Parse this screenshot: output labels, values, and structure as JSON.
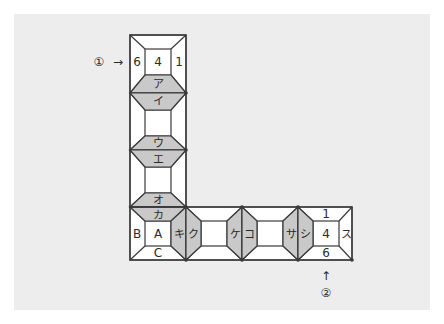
{
  "figure": {
    "type": "diagram",
    "background_color": "#ffffff",
    "panel_color": "#ededed",
    "line_color": "#3a3a3a",
    "cell_fill": "#ffffff",
    "shaded_fill": "#c9c9c9",
    "text_color": "#2b2b2b"
  },
  "markers": [
    {
      "id": "marker-1",
      "symbol": "①",
      "arrow": "→",
      "position": "left-of-top-cell"
    },
    {
      "id": "marker-2",
      "symbol": "②",
      "arrow": "↑",
      "position": "below-right-cell"
    }
  ],
  "vertical_column": {
    "orientation": "vertical",
    "cells": [
      {
        "index": 0,
        "faces": {
          "left": "6",
          "center": "4",
          "right": "1",
          "bottom": "ア"
        },
        "shaded_faces": [
          "bottom"
        ]
      },
      {
        "index": 1,
        "faces": {
          "top": "イ",
          "bottom": "ウ"
        },
        "shaded_faces": [
          "top",
          "bottom"
        ]
      },
      {
        "index": 2,
        "faces": {
          "top": "エ",
          "bottom": "オ"
        },
        "shaded_faces": [
          "top",
          "bottom"
        ]
      },
      {
        "index": 3,
        "faces": {
          "top": "カ",
          "left": "B",
          "center": "A",
          "bottom": "C"
        },
        "shaded_faces": [
          "top"
        ]
      }
    ]
  },
  "horizontal_row": {
    "orientation": "horizontal",
    "cells": [
      {
        "index": 0,
        "faces": {
          "top": "カ",
          "left": "B",
          "center": "A",
          "bottom": "C",
          "right": "キ"
        },
        "shaded_faces": [
          "top",
          "right"
        ],
        "note": "shared corner cell with vertical column"
      },
      {
        "index": 1,
        "faces": {
          "left": "ク",
          "right": "ケ"
        },
        "shaded_faces": [
          "left",
          "right"
        ]
      },
      {
        "index": 2,
        "faces": {
          "left": "コ",
          "right": "サ"
        },
        "shaded_faces": [
          "left",
          "right"
        ]
      },
      {
        "index": 3,
        "faces": {
          "left": "シ",
          "top": "1",
          "center": "4",
          "bottom": "6",
          "right": "ス"
        },
        "shaded_faces": [
          "left"
        ]
      }
    ]
  },
  "all_kana_labels": [
    "ア",
    "イ",
    "ウ",
    "エ",
    "オ",
    "カ",
    "キ",
    "ク",
    "ケ",
    "コ",
    "サ",
    "シ",
    "ス"
  ],
  "all_numbers": [
    "6",
    "4",
    "1",
    "1",
    "4",
    "6"
  ],
  "all_letters": [
    "B",
    "A",
    "C"
  ]
}
